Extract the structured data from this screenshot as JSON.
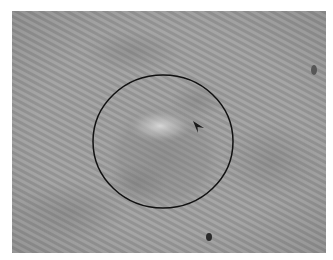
{
  "image": {
    "description": "Grayscale clinical photograph of a skin lesion with circular annotation and arrowhead marker",
    "frame": {
      "x": 12,
      "y": 11,
      "width": 314,
      "height": 242
    },
    "colors": {
      "background_skin": "#9c9c9c",
      "stripe_light": "#a8a8a8",
      "stripe_dark": "#8f8f8f",
      "lesion_shadow": "#858585",
      "lesion_highlight": "#cfcfcf",
      "annotation_stroke": "#111111",
      "spot": "#2a2a2a"
    },
    "annotation_circle": {
      "cx": 151,
      "cy": 130.5,
      "rx": 70,
      "ry": 66.5,
      "stroke_width": 1.5
    },
    "arrowhead": {
      "tip": [
        181,
        110
      ],
      "wing_right": [
        192,
        117
      ],
      "notch": [
        185,
        115
      ],
      "wing_bottom": [
        186,
        121
      ]
    },
    "dark_spots": [
      {
        "cx": 197,
        "cy": 226,
        "rx": 3,
        "ry": 4
      },
      {
        "cx": 302,
        "cy": 59,
        "rx": 3,
        "ry": 5
      }
    ]
  }
}
